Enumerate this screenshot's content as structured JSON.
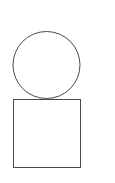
{
  "diagram": {
    "background": "#ffffff",
    "stroke": "#4a4a4a",
    "shapes": [
      {
        "type": "circle",
        "cx": 46.5,
        "cy": 65,
        "r": 33.5
      },
      {
        "type": "square",
        "x": 13,
        "y": 99,
        "width": 67,
        "height": 68
      }
    ]
  }
}
